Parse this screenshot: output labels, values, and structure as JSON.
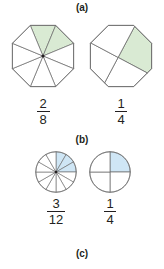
{
  "sections": [
    {
      "id": "a",
      "label": "(a)"
    },
    {
      "id": "b",
      "label": "(b)"
    },
    {
      "id": "c",
      "label": "(c)"
    }
  ],
  "colors": {
    "green_fill": "#d9ead3",
    "blue_fill": "#cfe6f5",
    "stroke": "#6b6b6b",
    "text": "#231f20",
    "background": "#ffffff"
  },
  "figures": {
    "row_a": {
      "left": {
        "shape": "octagon",
        "total_parts": 8,
        "shaded_parts": 2,
        "fill": "#d9ead3",
        "fraction": {
          "numerator": "2",
          "denominator": "8"
        },
        "shape_name": "octagon-eighths"
      },
      "right": {
        "shape": "octagon",
        "total_parts": 4,
        "shaded_parts": 1,
        "fill": "#d9ead3",
        "fraction": {
          "numerator": "1",
          "denominator": "4"
        },
        "shape_name": "octagon-quarters"
      }
    },
    "row_b": {
      "left": {
        "shape": "circle",
        "total_parts": 12,
        "shaded_parts": 3,
        "fill": "#cfe6f5",
        "fraction": {
          "numerator": "3",
          "denominator": "12"
        },
        "shape_name": "circle-twelfths"
      },
      "right": {
        "shape": "circle",
        "total_parts": 4,
        "shaded_parts": 1,
        "fill": "#cfe6f5",
        "fraction": {
          "numerator": "1",
          "denominator": "4"
        },
        "shape_name": "circle-quarters"
      }
    }
  }
}
